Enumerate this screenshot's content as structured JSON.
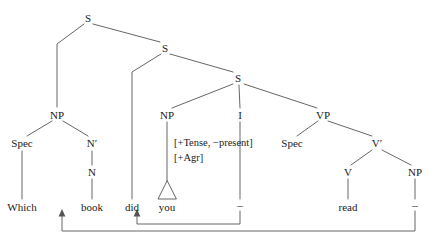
{
  "diagram": {
    "type": "syntax-tree",
    "sentence": "Which book did you read",
    "background_color": "#ffffff",
    "line_color": "#555555",
    "text_color": "#1a1a1a",
    "nodes": [
      {
        "id": "s-top",
        "label": "S",
        "x": 88,
        "y": 18
      },
      {
        "id": "s-mid",
        "label": "S",
        "x": 165,
        "y": 48
      },
      {
        "id": "s-low",
        "label": "S",
        "x": 238,
        "y": 78
      },
      {
        "id": "np-wh",
        "label": "NP",
        "x": 57,
        "y": 115
      },
      {
        "id": "spec-np-wh",
        "label": "Spec",
        "x": 22,
        "y": 143
      },
      {
        "id": "nbar",
        "label": "N′",
        "x": 92,
        "y": 143
      },
      {
        "id": "n",
        "label": "N",
        "x": 92,
        "y": 172
      },
      {
        "id": "np-subj",
        "label": "NP",
        "x": 167,
        "y": 115
      },
      {
        "id": "i",
        "label": "I",
        "x": 240,
        "y": 115
      },
      {
        "id": "vp",
        "label": "VP",
        "x": 323,
        "y": 115
      },
      {
        "id": "spec-vp",
        "label": "Spec",
        "x": 292,
        "y": 143
      },
      {
        "id": "vbar",
        "label": "V′",
        "x": 377,
        "y": 143
      },
      {
        "id": "v",
        "label": "V",
        "x": 348,
        "y": 172
      },
      {
        "id": "np-obj",
        "label": "NP",
        "x": 415,
        "y": 172
      }
    ],
    "terminals": [
      {
        "id": "term-which",
        "label": "Which",
        "x": 22,
        "y": 207
      },
      {
        "id": "term-book",
        "label": "book",
        "x": 92,
        "y": 207
      },
      {
        "id": "term-did",
        "label": "did",
        "x": 132,
        "y": 207
      },
      {
        "id": "term-you",
        "label": "you",
        "x": 167,
        "y": 207
      },
      {
        "id": "term-read",
        "label": "read",
        "x": 348,
        "y": 207
      }
    ],
    "traces": [
      {
        "id": "trace-i",
        "label": "–",
        "x": 240,
        "y": 205
      },
      {
        "id": "trace-np-obj",
        "label": "–",
        "x": 415,
        "y": 205
      }
    ],
    "features": [
      {
        "id": "feature-tense",
        "label": "[+Tense, −present]",
        "x": 174,
        "y": 143
      },
      {
        "id": "feature-agr",
        "label": "[+Agr]",
        "x": 174,
        "y": 158
      }
    ],
    "movement_arrows": [
      {
        "id": "movement-np-to-spec-cp",
        "from": "trace-np-obj",
        "to": "term-book"
      },
      {
        "id": "movement-i-to-c",
        "from": "trace-i",
        "to": "term-did"
      }
    ],
    "triangle": {
      "id": "triangle-you",
      "over": "term-you"
    }
  }
}
